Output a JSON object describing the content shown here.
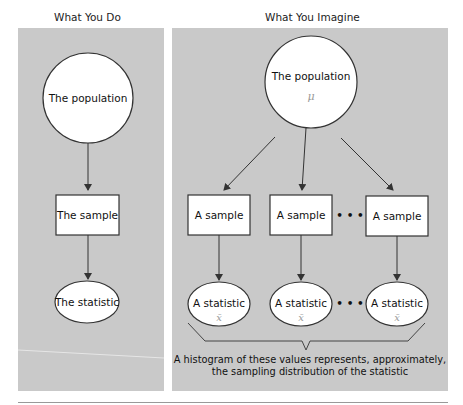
{
  "headings": {
    "left": "What You Do",
    "right": "What You Imagine"
  },
  "left_panel": {
    "population_label": "The population",
    "sample_label": "The sample",
    "statistic_label": "The statistic"
  },
  "right_panel": {
    "population_label": "The population",
    "population_symbol": "μ",
    "samples": [
      {
        "label": "A sample"
      },
      {
        "label": "A sample"
      },
      {
        "label": "A sample"
      }
    ],
    "statistics": [
      {
        "label": "A statistic",
        "symbol": "x̄"
      },
      {
        "label": "A statistic",
        "symbol": "x̄"
      },
      {
        "label": "A statistic",
        "symbol": "x̄"
      }
    ],
    "ellipsis": "• • •",
    "caption_line1": "A histogram of these values represents, approximately,",
    "caption_line2": "the sampling distribution of the statistic"
  },
  "colors": {
    "panel_bg": "#c9c9c9",
    "shape_fill": "#ffffff",
    "stroke": "#333333",
    "handwriting": "#9a9a9a"
  }
}
